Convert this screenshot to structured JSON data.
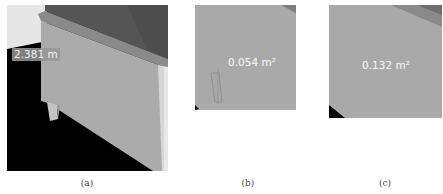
{
  "figure": {
    "panels": [
      {
        "id": "a",
        "caption": "(a)",
        "measurement": {
          "type": "distance",
          "value": "2.381 m"
        }
      },
      {
        "id": "b",
        "caption": "(b)",
        "measurement": {
          "type": "area",
          "value": "0.054 m²"
        }
      },
      {
        "id": "c",
        "caption": "(c)",
        "measurement": {
          "type": "area",
          "value": "0.132 m²"
        }
      }
    ]
  },
  "colors": {
    "background": "#ffffff",
    "scene_black": "#000000",
    "wall_light_gray": "#ababab",
    "top_dark_gray": "#555555",
    "ledge_gray": "#8a8a8a",
    "sky_light": "#e8e8e8",
    "label_bg": "#969696",
    "label_text": "#f2f2f2"
  }
}
